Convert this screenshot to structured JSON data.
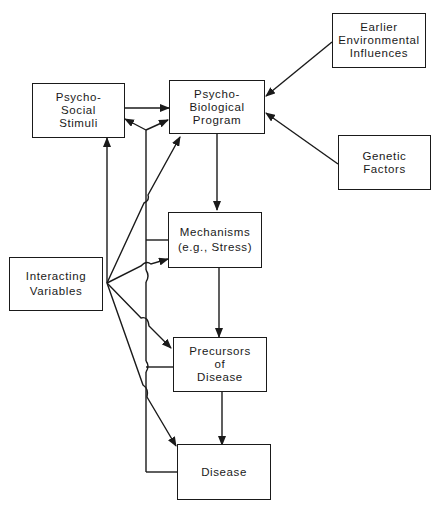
{
  "diagram": {
    "nodes": {
      "psychosocial": {
        "lines": [
          "Psycho-",
          "Social",
          "Stimuli"
        ]
      },
      "psychobiological": {
        "lines": [
          "Psycho-",
          "Biological",
          "Program"
        ]
      },
      "earlier": {
        "lines": [
          "Earlier",
          "Environmental",
          "Influences"
        ]
      },
      "genetic": {
        "lines": [
          "Genetic",
          "Factors"
        ]
      },
      "mechanisms": {
        "lines": [
          "Mechanisms",
          "(e.g., Stress)"
        ]
      },
      "interacting": {
        "lines": [
          "Interacting",
          "Variables"
        ]
      },
      "precursors": {
        "lines": [
          "Precursors",
          "of",
          "Disease"
        ]
      },
      "disease": {
        "lines": [
          "Disease"
        ]
      }
    },
    "edges": [
      {
        "from": "Psycho-Social Stimuli",
        "to": "Psycho-Biological Program"
      },
      {
        "from": "Earlier Environmental Influences",
        "to": "Psycho-Biological Program"
      },
      {
        "from": "Genetic Factors",
        "to": "Psycho-Biological Program"
      },
      {
        "from": "Psycho-Biological Program",
        "to": "Mechanisms (e.g., Stress)"
      },
      {
        "from": "Mechanisms (e.g., Stress)",
        "to": "Precursors of Disease"
      },
      {
        "from": "Precursors of Disease",
        "to": "Disease"
      },
      {
        "from": "Interacting Variables",
        "to": "Psycho-Social Stimuli"
      },
      {
        "from": "Interacting Variables",
        "to": "Psycho-Biological Program"
      },
      {
        "from": "Interacting Variables",
        "to": "Mechanisms (e.g., Stress)"
      },
      {
        "from": "Interacting Variables",
        "to": "Precursors of Disease"
      },
      {
        "from": "Interacting Variables",
        "to": "Disease"
      },
      {
        "from": "Feedback (Mechanisms, Precursors, Disease)",
        "to": "Psycho-Social Stimuli and Psycho-Biological Program"
      }
    ]
  }
}
